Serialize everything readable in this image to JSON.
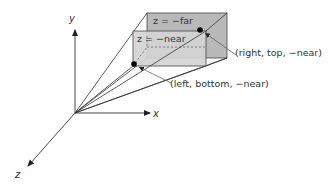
{
  "diagram": {
    "type": "perspective-view-frustum",
    "axes": {
      "x_label": "x",
      "y_label": "y",
      "z_label": "z"
    },
    "planes": {
      "far_label": "z = −far",
      "near_label": "z = −near"
    },
    "points": {
      "top_right_label": "(right, top, −near)",
      "bottom_left_label": "(left, bottom, −near)"
    },
    "colors": {
      "far_plane_fill": "#b8b8b8",
      "near_plane_fill": "#d2d2d2",
      "line": "#333333",
      "point": "#000000"
    }
  }
}
